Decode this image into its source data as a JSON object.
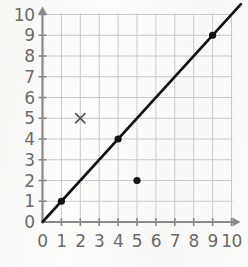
{
  "chart_data": {
    "type": "line",
    "title": "",
    "xlabel": "",
    "ylabel": "",
    "xlim": [
      0,
      10
    ],
    "ylim": [
      0,
      10
    ],
    "grid": true,
    "legend": "none",
    "x_tick_labels": [
      "0",
      "1",
      "2",
      "3",
      "4",
      "5",
      "6",
      "7",
      "8",
      "9",
      "10"
    ],
    "y_tick_labels": [
      "0",
      "1",
      "2",
      "3",
      "4",
      "5",
      "6",
      "7",
      "8",
      "9",
      "10"
    ],
    "x_ticks": [
      0,
      1,
      2,
      3,
      4,
      5,
      6,
      7,
      8,
      9,
      10
    ],
    "y_ticks": [
      0,
      1,
      2,
      3,
      4,
      5,
      6,
      7,
      8,
      9,
      10
    ],
    "series": [
      {
        "name": "line",
        "type": "line",
        "equation": "y = x",
        "x": [
          0,
          10.5
        ],
        "y": [
          0,
          10.5
        ],
        "color": "#111111",
        "width": 2.6
      }
    ],
    "points": [
      {
        "label": "point-1-1",
        "x": 1,
        "y": 1,
        "marker": "filled-circle",
        "color": "#111111",
        "on_line": true
      },
      {
        "label": "point-4-4",
        "x": 4,
        "y": 4,
        "marker": "filled-circle",
        "color": "#111111",
        "on_line": true
      },
      {
        "label": "point-9-9",
        "x": 9,
        "y": 9,
        "marker": "filled-circle",
        "color": "#111111",
        "on_line": true
      },
      {
        "label": "point-5-2",
        "x": 5,
        "y": 2,
        "marker": "filled-circle",
        "color": "#111111",
        "on_line": false
      },
      {
        "label": "point-2-5",
        "x": 2,
        "y": 5,
        "marker": "cross",
        "color": "#555555",
        "on_line": false
      }
    ],
    "axes": {
      "x_axis_arrow": true,
      "y_axis_arrow": true,
      "axis_color": "#8a8a8a",
      "grid_color": "#c9c9cb"
    }
  }
}
